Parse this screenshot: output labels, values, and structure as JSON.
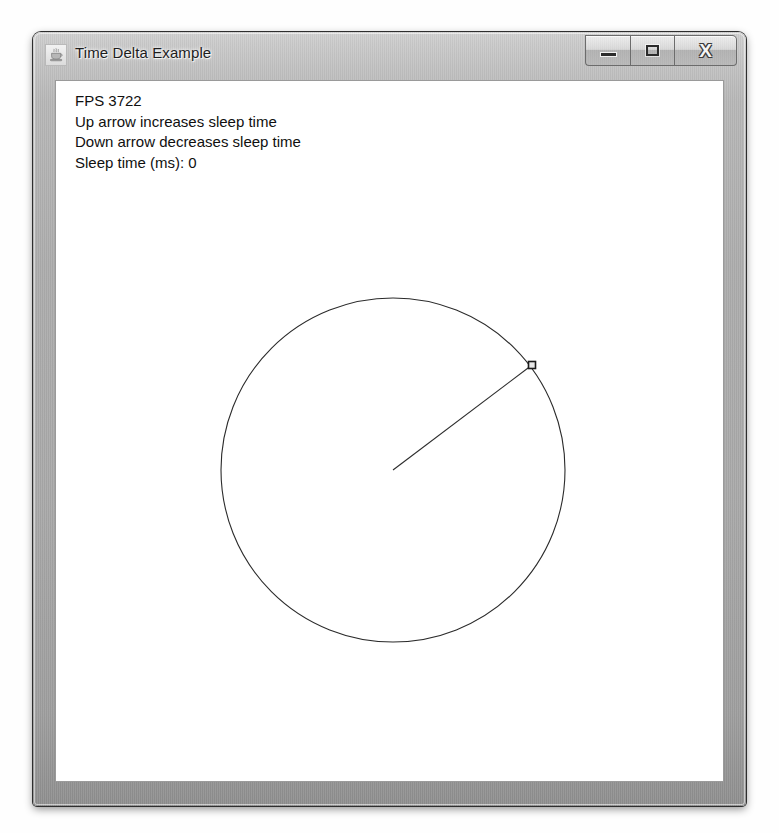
{
  "window": {
    "title": "Time Delta Example",
    "icon": "java-coffee-cup-icon",
    "caption_buttons": [
      {
        "name": "minimize",
        "label": "—",
        "glyph": "minimize-glyph"
      },
      {
        "name": "maximize",
        "label": "□",
        "glyph": "maximize-glyph"
      },
      {
        "name": "close",
        "label": "X",
        "glyph": "close-glyph"
      }
    ]
  },
  "content": {
    "status_lines": [
      "FPS 3722",
      "Up arrow increases sleep time",
      "Down arrow decreases sleep time",
      "Sleep time (ms): 0"
    ],
    "fps": "3722",
    "sleep_time_ms": "0"
  },
  "animation": {
    "circle": {
      "center_x": 337,
      "center_y": 389,
      "radius": 172,
      "stroke": "#2b2b2b",
      "stroke_width": 1,
      "fill": "none"
    },
    "hand": {
      "from_x": 337,
      "from_y": 389,
      "to_x": 476,
      "to_y": 284,
      "stroke": "#2b2b2b",
      "stroke_width": 1
    },
    "marker": {
      "x": 476,
      "y": 284,
      "size": 7,
      "stroke": "#1a1a1a",
      "fill": "#e8e8e8"
    }
  },
  "colors": {
    "frame": "#a8a8a8",
    "client_background": "#ffffff",
    "text": "#101010",
    "ink": "#2b2b2b"
  }
}
